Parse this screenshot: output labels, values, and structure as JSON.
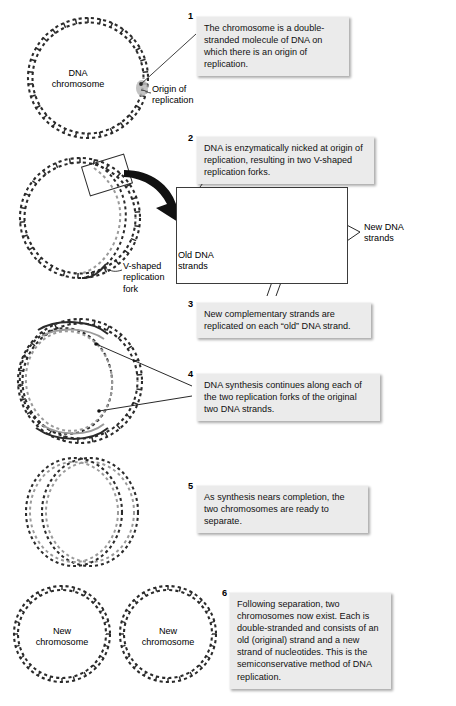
{
  "figure": {
    "colors": {
      "old_strand": "#2b2b2b",
      "new_strand": "#9a9a9a",
      "callout_bg": "#ebebeb",
      "text": "#111111",
      "background": "#ffffff",
      "arrow": "#111111"
    }
  },
  "steps": [
    {
      "number": "1",
      "text": "The chromosome is a double-stranded molecule of DNA on which there is an origin of replication."
    },
    {
      "number": "2",
      "text": "DNA is enzymatically nicked at origin of replication, resulting in two V-shaped replication forks."
    },
    {
      "number": "3",
      "text": "New complementary strands are replicated on each “old” DNA strand."
    },
    {
      "number": "4",
      "text": "DNA synthesis continues along each of the two replication forks of the original two DNA strands."
    },
    {
      "number": "5",
      "text": "As synthesis nears completion, the two chromosomes are ready to separate."
    },
    {
      "number": "6",
      "text": "Following separation, two chromosomes now exist. Each is double-stranded and consists of an old (original) strand and a new strand of nucleotides. This is the semiconservative method of DNA replication."
    }
  ],
  "labels": {
    "dna_chromosome": "DNA\nchromosome",
    "dna_chromosome_line1": "DNA",
    "dna_chromosome_line2": "chromosome",
    "origin_of_replication_line1": "Origin of",
    "origin_of_replication_line2": "replication",
    "v_shaped_fork_line1": "V-shaped",
    "v_shaped_fork_line2": "replication",
    "v_shaped_fork_line3": "fork",
    "old_dna_strands_line1": "Old DNA",
    "old_dna_strands_line2": "strands",
    "new_dna_strands_line1": "New DNA",
    "new_dna_strands_line2": "strands",
    "new_chromosome_left_line1": "New",
    "new_chromosome_left_line2": "chromosome",
    "new_chromosome_right_line1": "New",
    "new_chromosome_right_line2": "chromosome"
  },
  "stages": [
    {
      "name": "stage-1-intact-chromosome",
      "caption": "Intact circular DNA chromosome with origin of replication"
    },
    {
      "name": "stage-2-nicked-chromosome",
      "caption": "Chromosome nicked at origin forming replication bubble"
    },
    {
      "name": "stage-3-theta-structure",
      "caption": "Theta structure with new strands synthesized along both forks"
    },
    {
      "name": "stage-4-near-complete",
      "caption": "Two nearly complete daughter chromosomes"
    },
    {
      "name": "stage-5-separated",
      "caption": "Two separated new chromosomes"
    }
  ],
  "inset": {
    "name": "replication-fork-detail",
    "caption": "Detail of a replication fork showing old and new DNA strands"
  }
}
